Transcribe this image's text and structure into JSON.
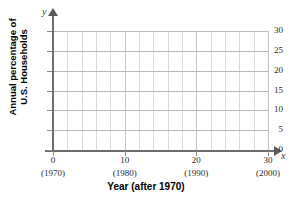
{
  "chart_data": {
    "type": "line",
    "title": "",
    "xlabel": "Year (after 1970)",
    "ylabel_line1": "Annual percentage of",
    "ylabel_line2": "U.S. Households",
    "x_axis_letter": "x",
    "y_axis_letter": "y",
    "xlim": [
      0,
      30
    ],
    "ylim": [
      0,
      30
    ],
    "grid": true,
    "grid_major_x_step": 10,
    "grid_minor_x_step": 2,
    "grid_major_y_step": 5,
    "legend": "none",
    "series": [],
    "values": [],
    "categories": [],
    "x_ticks": [
      {
        "value": 0,
        "label": "0",
        "year": "(1970)"
      },
      {
        "value": 10,
        "label": "10",
        "year": "(1980)"
      },
      {
        "value": 20,
        "label": "20",
        "year": "(1990)"
      },
      {
        "value": 30,
        "label": "30",
        "year": "(2000)"
      }
    ],
    "y_ticks": [
      {
        "value": 0,
        "label": "0"
      },
      {
        "value": 5,
        "label": "5"
      },
      {
        "value": 10,
        "label": "10"
      },
      {
        "value": 15,
        "label": "15"
      },
      {
        "value": 20,
        "label": "20"
      },
      {
        "value": 25,
        "label": "25"
      },
      {
        "value": 30,
        "label": "30"
      }
    ],
    "colors": {
      "background": "#ffffff",
      "axis": "#6e6e6e",
      "grid_minor": "#d9d9d9",
      "grid_major": "#b9b9b9",
      "text": "#000000"
    }
  }
}
